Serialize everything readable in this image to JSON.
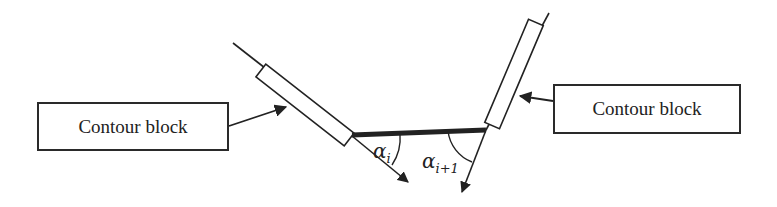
{
  "diagram": {
    "left_label": "Contour block",
    "right_label": "Contour block",
    "angle_left": {
      "symbol": "α",
      "subscript": "i"
    },
    "angle_right": {
      "symbol": "α",
      "subscript": "i+1"
    },
    "colors": {
      "stroke": "#222222",
      "background": "#ffffff"
    }
  }
}
